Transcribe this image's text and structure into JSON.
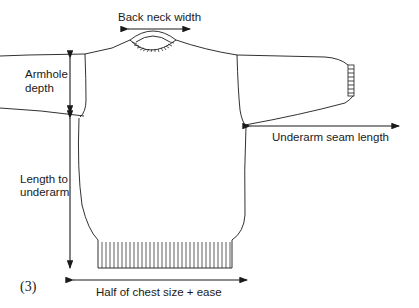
{
  "figure_number": "(3)",
  "labels": {
    "back_neck_width": "Back neck width",
    "armhole_depth_line1": "Armhole",
    "armhole_depth_line2": "depth",
    "length_to_underarm_line1": "Length to",
    "length_to_underarm_line2": "underarm",
    "underarm_seam_length": "Underarm seam length",
    "half_chest": "Half of chest size + ease"
  },
  "colors": {
    "line": "#1a1a1a",
    "background": "#ffffff"
  }
}
